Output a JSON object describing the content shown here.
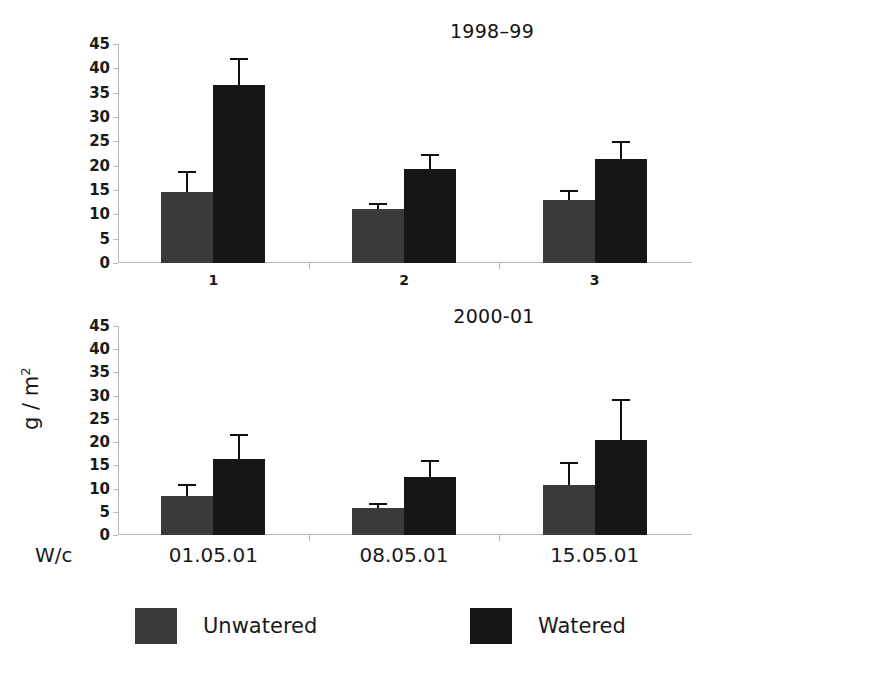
{
  "figure": {
    "y_axis_title": "g / m",
    "y_axis_title_exponent": "2",
    "wc_label": "W/c"
  },
  "legend": {
    "position": "bottom",
    "items": [
      {
        "label": "Unwatered",
        "color": "#3A3A3A",
        "key": "unwatered"
      },
      {
        "label": "Watered",
        "color": "#161616",
        "key": "watered"
      }
    ]
  },
  "chart_data": [
    {
      "type": "bar",
      "title": "1998–99",
      "xlabel": "",
      "ylabel": "g / m2",
      "ylim": [
        0,
        45
      ],
      "yticks": [
        0,
        5,
        10,
        15,
        20,
        25,
        30,
        35,
        40,
        45
      ],
      "grid": false,
      "categories": [
        "1",
        "2",
        "3"
      ],
      "series": [
        {
          "name": "Unwatered",
          "color": "#3A3A3A",
          "values": [
            14.5,
            11.0,
            13.0
          ],
          "errors": [
            4.0,
            1.0,
            1.5
          ]
        },
        {
          "name": "Watered",
          "color": "#161616",
          "values": [
            36.5,
            19.4,
            21.4
          ],
          "errors": [
            5.3,
            2.5,
            3.2
          ]
        }
      ]
    },
    {
      "type": "bar",
      "title": "2000-01",
      "xlabel": "W/c",
      "ylabel": "g / m2",
      "ylim": [
        0,
        45
      ],
      "yticks": [
        0,
        5,
        10,
        15,
        20,
        25,
        30,
        35,
        40,
        45
      ],
      "grid": false,
      "categories": [
        "01.05.01",
        "08.05.01",
        "15.05.01"
      ],
      "series": [
        {
          "name": "Unwatered",
          "color": "#3A3A3A",
          "values": [
            8.3,
            5.8,
            10.8
          ],
          "errors": [
            2.2,
            0.7,
            4.5
          ]
        },
        {
          "name": "Watered",
          "color": "#161616",
          "values": [
            16.3,
            12.5,
            20.5
          ],
          "errors": [
            5.0,
            3.2,
            8.4
          ]
        }
      ]
    }
  ]
}
